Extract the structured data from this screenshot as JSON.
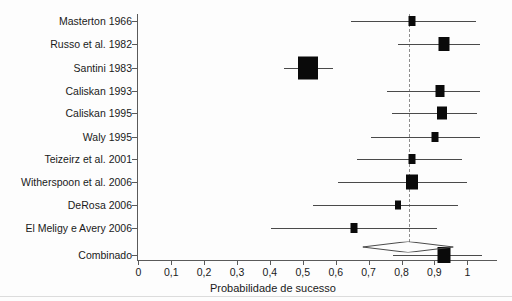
{
  "chart_data": {
    "type": "scatter",
    "subtype": "forest-plot",
    "title": "",
    "xlabel": "Probabilidade de sucesso",
    "ylabel": "",
    "xlim": [
      0,
      1.09
    ],
    "xticks": [
      0,
      0.1,
      0.2,
      0.3,
      0.4,
      0.5,
      0.6,
      0.7,
      0.8,
      0.9,
      1
    ],
    "xticklabels": [
      "0",
      "0,1",
      "0,2",
      "0,3",
      "0,4",
      "0,5",
      "0,6",
      "0,7",
      "0,8",
      "0,9",
      "1"
    ],
    "grid": false,
    "legend": null,
    "reference_line": {
      "value": 0.823,
      "style": "dashed",
      "color": "#8e8e8e",
      "label": ""
    },
    "categories": [
      "Masterton 1966",
      "Russo et al. 1982",
      "Santini 1983",
      "Caliskan 1993",
      "Caliskan 1995",
      "Waly 1995",
      "Teizeirz et al. 2001",
      "Witherspoon et al. 2006",
      "DeRosa 2006",
      "El Meligy e Avery 2006",
      "Combinado"
    ],
    "studies": [
      {
        "label": "Masterton 1966",
        "estimate": 0.833,
        "ci_low": 0.646,
        "ci_high": 1.025,
        "weight_box_px": 7
      },
      {
        "label": "Russo et al. 1982",
        "estimate": 0.929,
        "ci_low": 0.788,
        "ci_high": 1.04,
        "weight_box_px": 11
      },
      {
        "label": "Santini 1983",
        "estimate": 0.517,
        "ci_low": 0.443,
        "ci_high": 0.592,
        "weight_box_px": 20
      },
      {
        "label": "Caliskan 1993",
        "estimate": 0.917,
        "ci_low": 0.757,
        "ci_high": 1.04,
        "weight_box_px": 9
      },
      {
        "label": "Caliskan 1995",
        "estimate": 0.923,
        "ci_low": 0.772,
        "ci_high": 1.03,
        "weight_box_px": 10
      },
      {
        "label": "Waly 1995",
        "estimate": 0.902,
        "ci_low": 0.706,
        "ci_high": 1.04,
        "weight_box_px": 7
      },
      {
        "label": "Teizeirz et al. 2001",
        "estimate": 0.833,
        "ci_low": 0.665,
        "ci_high": 0.985,
        "weight_box_px": 7
      },
      {
        "label": "Witherspoon et al. 2006",
        "estimate": 0.833,
        "ci_low": 0.607,
        "ci_high": 1.0,
        "weight_box_px": 12
      },
      {
        "label": "DeRosa 2006",
        "estimate": 0.79,
        "ci_low": 0.53,
        "ci_high": 0.972,
        "weight_box_px": 6
      },
      {
        "label": "El Meligy e Avery 2006",
        "estimate": 0.656,
        "ci_low": 0.402,
        "ci_high": 0.909,
        "weight_box_px": 7
      },
      {
        "label": "Combinado",
        "estimate": 0.93,
        "ci_low": 0.775,
        "ci_high": 1.045,
        "weight_box_px": 13
      }
    ],
    "pooled": {
      "label": "Combinado",
      "estimate": 0.823,
      "ci_low": 0.682,
      "ci_high": 0.958,
      "marker": "diamond"
    }
  },
  "colors": {
    "marker": "#0a0a0a",
    "line": "#4a4a4a",
    "axis": "#5a5a5a",
    "reference": "#8e8e8e",
    "background": "#fdfdfd",
    "text": "#1a1a1a"
  }
}
